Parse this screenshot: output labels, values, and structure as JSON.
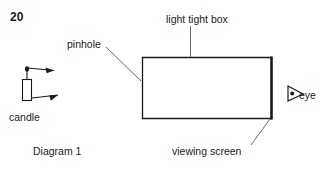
{
  "figure": {
    "question_number": "20",
    "caption": "Diagram 1",
    "labels": {
      "pinhole": "pinhole",
      "light_tight_box": "light tight box",
      "viewing_screen": "viewing screen",
      "candle": "candle",
      "eye": "eye"
    },
    "colors": {
      "ink": "#1a1a1a",
      "background": "#ffffff"
    },
    "elements": {
      "box": {
        "x": 142,
        "y": 57,
        "width": 130,
        "height": 62
      },
      "screen_edge": "right",
      "pinhole_position": "left edge of box",
      "candle": {
        "x": 22,
        "y": 74,
        "width": 10,
        "height": 26
      },
      "rays": 2,
      "eye_position": "right of box"
    }
  }
}
